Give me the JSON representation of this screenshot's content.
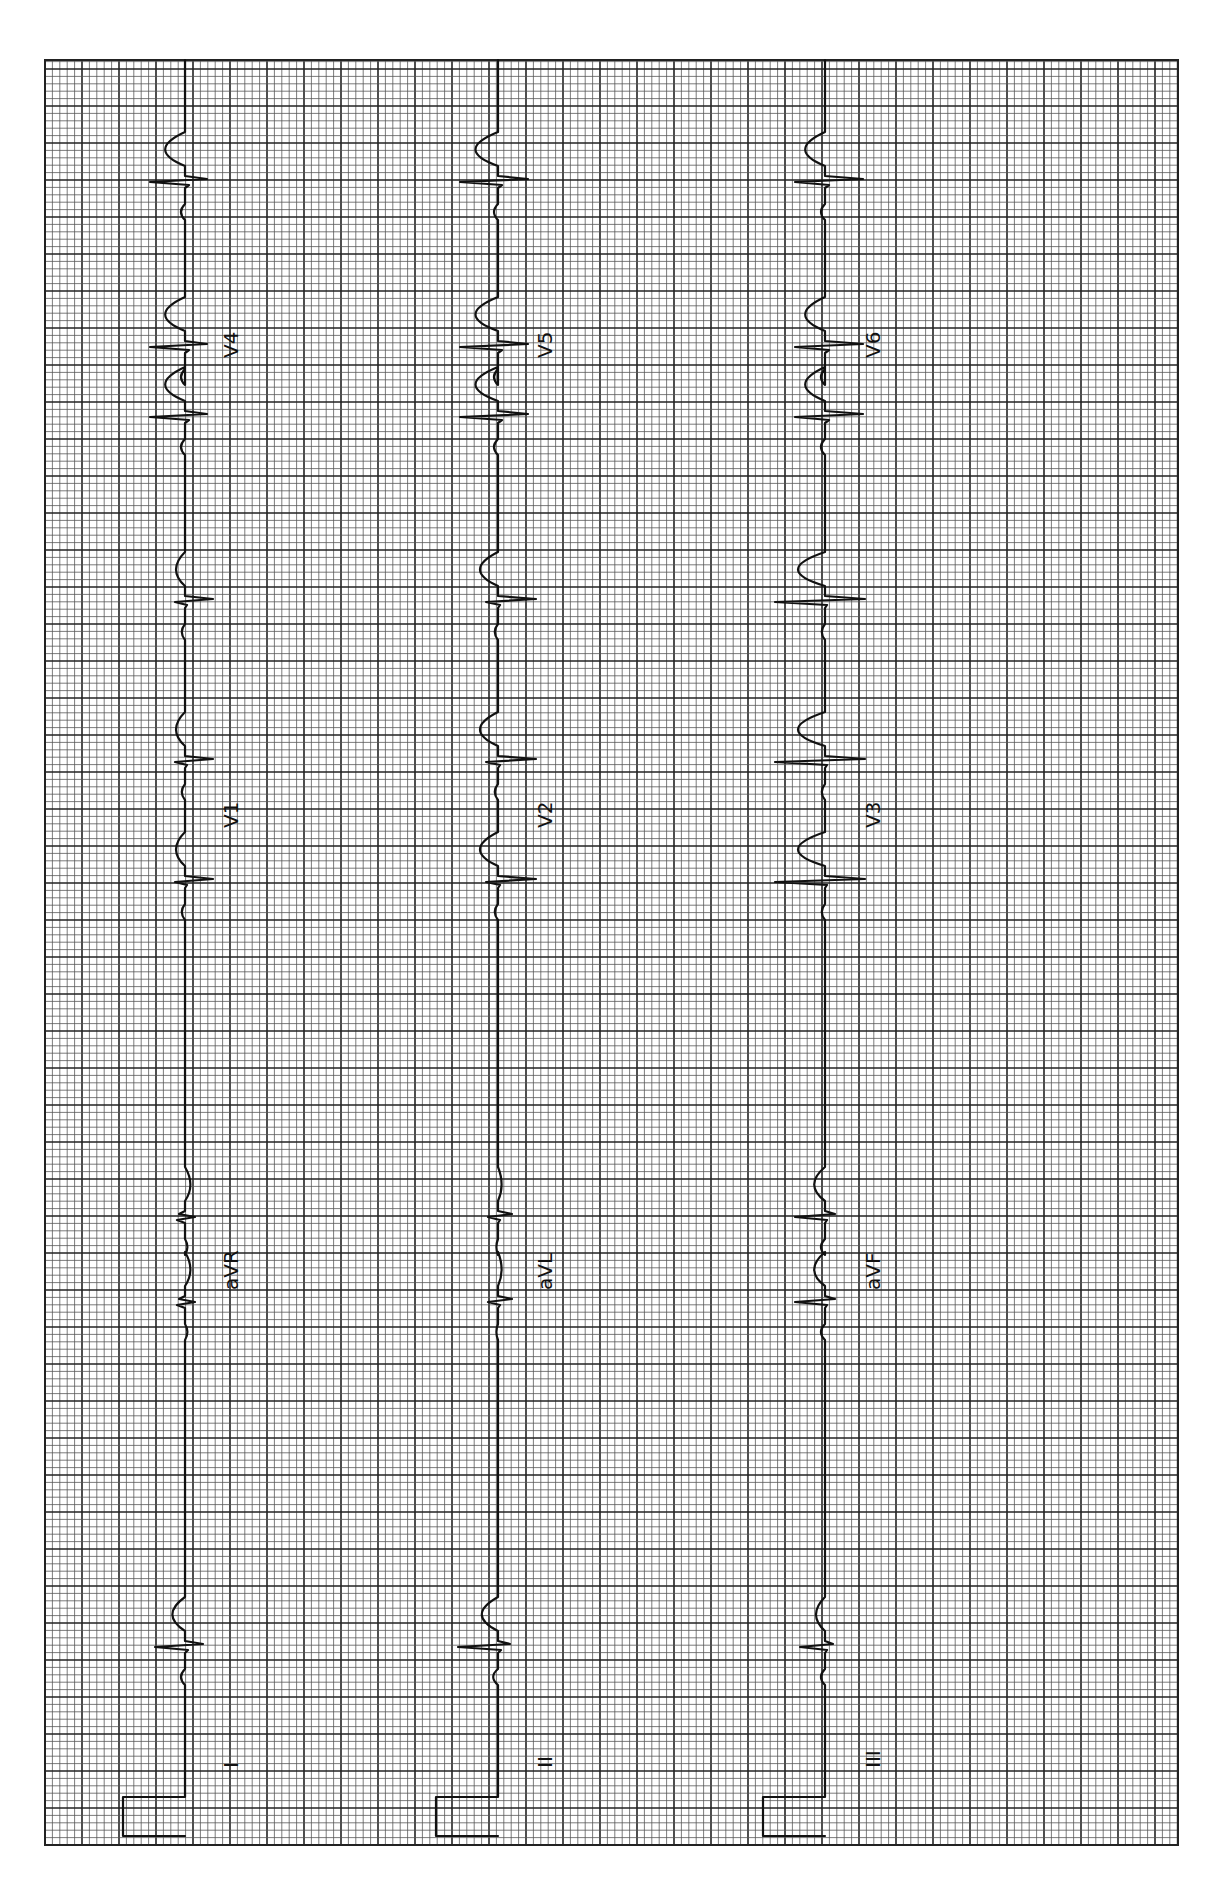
{
  "document": {
    "type": "12-lead ECG tracing (rotated 90°)",
    "orientation": "rotated counter-clockwise; time axis runs bottom-to-top"
  },
  "grid": {
    "small_box_px": 7.4,
    "large_box_px": 37,
    "left": 45,
    "top": 60,
    "right": 1178,
    "bottom": 1845,
    "color_small": "#555555",
    "color_large": "#222222"
  },
  "strips": [
    {
      "baseline_x": 185,
      "calibration": {
        "x_left": 123,
        "y_top": 1797,
        "y_bottom": 1836
      },
      "segments": [
        {
          "label": "I",
          "label_pos": {
            "x": 238,
            "y": 1768
          }
        },
        {
          "label": "aVR",
          "label_pos": {
            "x": 238,
            "y": 1290
          }
        },
        {
          "label": "V1",
          "label_pos": {
            "x": 238,
            "y": 828
          }
        },
        {
          "label": "V4",
          "label_pos": {
            "x": 238,
            "y": 358
          }
        }
      ],
      "beats_y": [
        1645,
        1300,
        1215,
        880,
        760,
        600,
        415,
        345,
        180
      ]
    },
    {
      "baseline_x": 498,
      "calibration": {
        "x_left": 436,
        "y_top": 1797,
        "y_bottom": 1836
      },
      "segments": [
        {
          "label": "II",
          "label_pos": {
            "x": 552,
            "y": 1768
          }
        },
        {
          "label": "aVL",
          "label_pos": {
            "x": 552,
            "y": 1290
          }
        },
        {
          "label": "V2",
          "label_pos": {
            "x": 552,
            "y": 828
          }
        },
        {
          "label": "V5",
          "label_pos": {
            "x": 552,
            "y": 358
          }
        }
      ],
      "beats_y": [
        1645,
        1300,
        1215,
        880,
        760,
        600,
        415,
        345,
        180
      ]
    },
    {
      "baseline_x": 825,
      "calibration": {
        "x_left": 763,
        "y_top": 1797,
        "y_bottom": 1836
      },
      "segments": [
        {
          "label": "III",
          "label_pos": {
            "x": 880,
            "y": 1768
          }
        },
        {
          "label": "aVF",
          "label_pos": {
            "x": 880,
            "y": 1290
          }
        },
        {
          "label": "V3",
          "label_pos": {
            "x": 880,
            "y": 828
          }
        },
        {
          "label": "V6",
          "label_pos": {
            "x": 880,
            "y": 358
          }
        }
      ],
      "beats_y": [
        1645,
        1300,
        1215,
        880,
        760,
        600,
        415,
        345,
        180
      ]
    }
  ],
  "labels": {
    "strip_0": [
      "I",
      "aVR",
      "V1",
      "V4"
    ],
    "strip_1": [
      "II",
      "aVL",
      "V2",
      "V5"
    ],
    "strip_2": [
      "III",
      "aVF",
      "V3",
      "V6"
    ]
  }
}
